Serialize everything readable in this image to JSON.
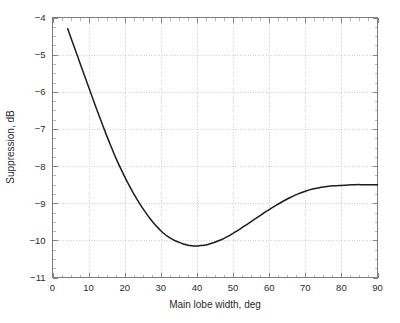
{
  "chart_data": {
    "type": "line",
    "title": "",
    "xlabel": "Main lobe width, deg",
    "ylabel": "Suppression, dB",
    "xlim": [
      0,
      90
    ],
    "ylim": [
      -11,
      -4
    ],
    "xticks": [
      0,
      10,
      20,
      30,
      40,
      50,
      60,
      70,
      80,
      90
    ],
    "yticks": [
      -11,
      -10,
      -9,
      -8,
      -7,
      -6,
      -5,
      -4
    ],
    "xtick_labels": [
      "0",
      "10",
      "20",
      "30",
      "40",
      "50",
      "60",
      "70",
      "80",
      "90"
    ],
    "ytick_labels": [
      "-11",
      "-10",
      "-9",
      "-8",
      "-7",
      "-6",
      "-5",
      "-4"
    ],
    "grid": true,
    "grid_style": "dotted",
    "legend": null,
    "series": [
      {
        "name": "Suppression vs main lobe width",
        "color": "#1c1c1c",
        "x": [
          4.2,
          5,
          6,
          7,
          8,
          9,
          10,
          11,
          12,
          13,
          14,
          15,
          16,
          17,
          18,
          19,
          20,
          21,
          22,
          23,
          24,
          25,
          26,
          27,
          28,
          29,
          30,
          31,
          32,
          33,
          34,
          35,
          36,
          37,
          38,
          39,
          40,
          41,
          42,
          43,
          44,
          45,
          46,
          47,
          48,
          49,
          50,
          52,
          54,
          56,
          58,
          60,
          62,
          64,
          66,
          68,
          70,
          72,
          74,
          76,
          78,
          80,
          82,
          84,
          86,
          88,
          90
        ],
        "y": [
          -4.3,
          -4.52,
          -4.79,
          -5.06,
          -5.33,
          -5.6,
          -5.87,
          -6.14,
          -6.41,
          -6.67,
          -6.93,
          -7.18,
          -7.42,
          -7.66,
          -7.88,
          -8.09,
          -8.29,
          -8.48,
          -8.66,
          -8.83,
          -8.99,
          -9.14,
          -9.28,
          -9.41,
          -9.53,
          -9.64,
          -9.74,
          -9.83,
          -9.9,
          -9.96,
          -10.01,
          -10.05,
          -10.09,
          -10.12,
          -10.14,
          -10.15,
          -10.15,
          -10.14,
          -10.13,
          -10.11,
          -10.08,
          -10.05,
          -10.01,
          -9.97,
          -9.92,
          -9.87,
          -9.81,
          -9.69,
          -9.56,
          -9.43,
          -9.3,
          -9.17,
          -9.05,
          -8.94,
          -8.84,
          -8.75,
          -8.68,
          -8.62,
          -8.58,
          -8.55,
          -8.53,
          -8.52,
          -8.51,
          -8.5,
          -8.5,
          -8.5,
          -8.5
        ]
      }
    ],
    "minimum": {
      "x": 39.5,
      "y": -10.15
    },
    "start_point": {
      "x": 4.2,
      "y": -4.3
    },
    "end_point": {
      "x": 90,
      "y": -8.5
    }
  },
  "axes": {
    "x_title": "Main lobe width, deg",
    "y_title": "Suppression, dB"
  }
}
